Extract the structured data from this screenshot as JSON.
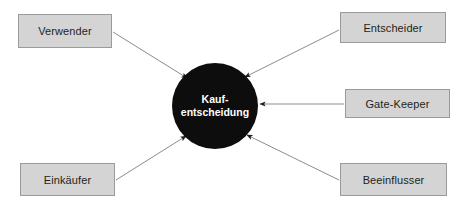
{
  "diagram": {
    "type": "hub-and-spoke",
    "canvas": {
      "width": 456,
      "height": 211,
      "background": "#ffffff"
    },
    "hub": {
      "name": "kaufentscheidung",
      "line1": "Kauf-",
      "line2": "entscheidung",
      "shape": "circle",
      "fill": "#0d0d0d",
      "text_color": "#ffffff",
      "cx": 215,
      "cy": 106,
      "r": 43
    },
    "node_style": {
      "fill": "#d4d4d4",
      "border": "#9a9a9a",
      "text_color": "#231f20"
    },
    "edge_style": {
      "stroke": "#8c8c8c",
      "arrowhead_fill": "#231f20",
      "direction": "to-hub"
    },
    "nodes": [
      {
        "id": "verwender",
        "label": "Verwender",
        "x": 18,
        "y": 14,
        "w": 94,
        "h": 34
      },
      {
        "id": "entscheider",
        "label": "Entscheider",
        "x": 340,
        "y": 12,
        "w": 106,
        "h": 31
      },
      {
        "id": "gatekeeper",
        "label": "Gate-Keeper",
        "x": 345,
        "y": 89,
        "w": 105,
        "h": 29
      },
      {
        "id": "beeinflusser",
        "label": "Beeinflusser",
        "x": 340,
        "y": 163,
        "w": 107,
        "h": 33
      },
      {
        "id": "einkaeufer",
        "label": "Einkäufer",
        "x": 20,
        "y": 163,
        "w": 95,
        "h": 33
      }
    ],
    "edges": [
      {
        "from": "verwender",
        "to": "kaufentscheidung",
        "x1": 113,
        "y1": 32,
        "x2": 187,
        "y2": 78
      },
      {
        "from": "entscheider",
        "to": "kaufentscheidung",
        "x1": 339,
        "y1": 30,
        "x2": 245,
        "y2": 77
      },
      {
        "from": "gatekeeper",
        "to": "kaufentscheidung",
        "x1": 344,
        "y1": 104,
        "x2": 260,
        "y2": 104
      },
      {
        "from": "beeinflusser",
        "to": "kaufentscheidung",
        "x1": 339,
        "y1": 180,
        "x2": 247,
        "y2": 135
      },
      {
        "from": "einkaeufer",
        "to": "kaufentscheidung",
        "x1": 116,
        "y1": 180,
        "x2": 186,
        "y2": 136
      }
    ]
  }
}
